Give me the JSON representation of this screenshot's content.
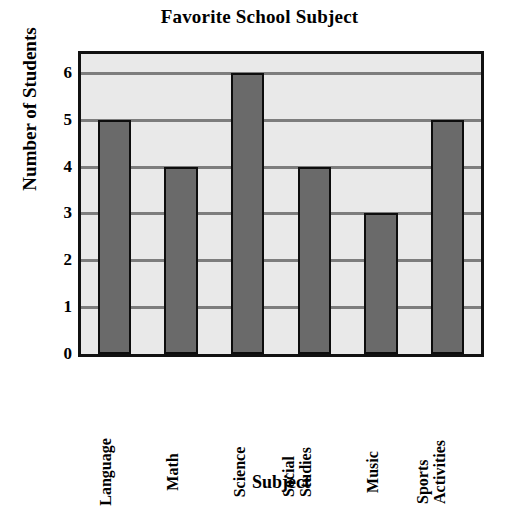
{
  "chart_data": {
    "type": "bar",
    "title": "Favorite School Subject",
    "xlabel": "Subject",
    "ylabel": "Number of Students",
    "categories": [
      "Language",
      "Math",
      "Science",
      "Social Studies",
      "Music",
      "Sports Activities"
    ],
    "values": [
      5,
      4,
      6,
      4,
      3,
      5
    ],
    "ylim": [
      0,
      6.4
    ],
    "yticks": [
      0,
      1,
      2,
      3,
      4,
      5,
      6
    ],
    "ytick_labels": [
      "0",
      "1",
      "2",
      "3",
      "4",
      "5",
      "6"
    ],
    "grid": true,
    "grid_axis": "y",
    "legend": false,
    "legend_position": "none",
    "xtick_rotation": 90,
    "colors": {
      "bar_fill": "#6a6a6a",
      "bar_edge": "#0d0d0d",
      "plot_background": "#e9e9e9",
      "gridline": "#7d7d7d",
      "frame": "#111111",
      "text": "#000000",
      "page_background": "#ffffff"
    },
    "category_label_lines": [
      [
        "Language"
      ],
      [
        "Math"
      ],
      [
        "Science"
      ],
      [
        "Social",
        "Studies"
      ],
      [
        "Music"
      ],
      [
        "Sports",
        "Activities"
      ]
    ]
  }
}
